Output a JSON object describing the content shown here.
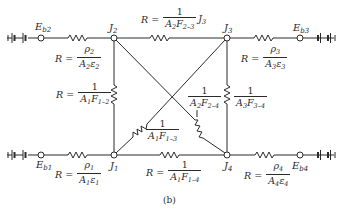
{
  "figure": {
    "caption": "(b)",
    "type": "radiation network diagram (four-surface enclosure)"
  },
  "nodes": {
    "Eb1": {
      "label": "E",
      "sub": "b1"
    },
    "Eb2": {
      "label": "E",
      "sub": "b2"
    },
    "Eb3": {
      "label": "E",
      "sub": "b3"
    },
    "Eb4": {
      "label": "E",
      "sub": "b4"
    },
    "J1": {
      "label": "J",
      "sub": "1"
    },
    "J2": {
      "label": "J",
      "sub": "2"
    },
    "J3": {
      "label": "J",
      "sub": "3"
    },
    "J4": {
      "label": "J",
      "sub": "4"
    }
  },
  "resistors": {
    "surface1": {
      "prefix": "R =",
      "num": "ρ",
      "num_sub": "1",
      "den": "A",
      "den_sub": "1",
      "den2": "ε",
      "den2_sub": "1"
    },
    "surface2": {
      "prefix": "R =",
      "num": "ρ",
      "num_sub": "2",
      "den": "A",
      "den_sub": "2",
      "den2": "ε",
      "den2_sub": "2"
    },
    "surface3": {
      "prefix": "R =",
      "num": "ρ",
      "num_sub": "3",
      "den": "A",
      "den_sub": "3",
      "den2": "ε",
      "den2_sub": "3"
    },
    "surface4": {
      "prefix": "R =",
      "num": "ρ",
      "num_sub": "4",
      "den": "A",
      "den_sub": "4",
      "den2": "ε",
      "den2_sub": "4"
    },
    "space23": {
      "prefix": "R =",
      "num": "1",
      "den": "A",
      "den_sub": "2",
      "den2": "F",
      "den2_sub": "2–3",
      "suffix_label": "J",
      "suffix_sub": "3"
    },
    "space12": {
      "prefix": "R =",
      "num": "1",
      "den": "A",
      "den_sub": "1",
      "den2": "F",
      "den2_sub": "1–2"
    },
    "space13": {
      "num": "1",
      "den": "A",
      "den_sub": "1",
      "den2": "F",
      "den2_sub": "1–3"
    },
    "space24": {
      "num": "1",
      "den": "A",
      "den_sub": "2",
      "den2": "F",
      "den2_sub": "2–4"
    },
    "space34": {
      "num": "1",
      "den": "A",
      "den_sub": "3",
      "den2": "F",
      "den2_sub": "3–4"
    },
    "space14": {
      "prefix": "R =",
      "num": "1",
      "den": "A",
      "den_sub": "1",
      "den2": "F",
      "den2_sub": "1–4"
    }
  },
  "colors": {
    "ink": "#2a2a2a",
    "background": "#ffffff"
  }
}
